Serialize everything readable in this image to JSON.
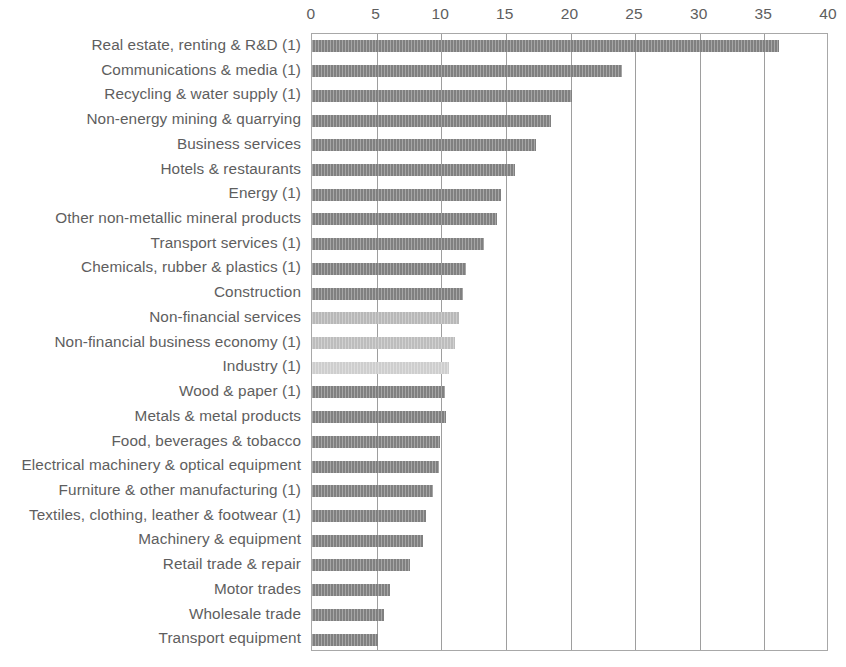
{
  "chart_data": {
    "type": "bar",
    "orientation": "horizontal",
    "title": "",
    "subtitle": "",
    "xlabel": "",
    "ylabel": "",
    "xlim": [
      0,
      40
    ],
    "xticks": [
      0,
      5,
      10,
      15,
      20,
      25,
      30,
      35,
      40
    ],
    "xtick_labels": [
      "0",
      "5",
      "10",
      "15",
      "20",
      "25",
      "30",
      "35",
      "40"
    ],
    "grid": true,
    "grid_axis": "x",
    "legend": null,
    "axis_position": "top",
    "categories": [
      "Real estate, renting & R&D (1)",
      "Communications & media (1)",
      "Recycling & water supply (1)",
      "Non-energy mining & quarrying",
      "Business services",
      "Hotels & restaurants",
      "Energy (1)",
      "Other non-metallic mineral products",
      "Transport services (1)",
      "Chemicals, rubber & plastics (1)",
      "Construction",
      "Non-financial services",
      "Non-financial business economy (1)",
      "Industry (1)",
      "Wood & paper (1)",
      "Metals & metal products",
      "Food, beverages & tobacco",
      "Electrical machinery & optical equipment",
      "Furniture & other manufacturing (1)",
      "Textiles, clothing, leather & footwear (1)",
      "Machinery & equipment",
      "Retail trade & repair",
      "Motor trades",
      "Wholesale trade",
      "Transport equipment"
    ],
    "values": [
      36.1,
      24.0,
      20.1,
      18.5,
      17.3,
      15.7,
      14.6,
      14.3,
      13.3,
      11.9,
      11.7,
      11.4,
      11.1,
      10.6,
      10.3,
      10.4,
      9.9,
      9.8,
      9.4,
      8.8,
      8.6,
      7.6,
      6.0,
      5.6,
      5.1
    ],
    "bar_colors": [
      "#808080",
      "#808080",
      "#808080",
      "#808080",
      "#808080",
      "#808080",
      "#808080",
      "#808080",
      "#808080",
      "#808080",
      "#808080",
      "#b8b8b8",
      "#bdbdbd",
      "#cecece",
      "#808080",
      "#808080",
      "#808080",
      "#808080",
      "#808080",
      "#808080",
      "#808080",
      "#808080",
      "#808080",
      "#808080",
      "#808080"
    ],
    "colors": {
      "bar_default": "#808080",
      "bar_highlight_light": "#b8b8b8",
      "bar_highlight_lighter": "#bdbdbd",
      "bar_highlight_lightest": "#cecece",
      "grid": "#9e9e9e",
      "frame": "#a8a8a8",
      "text": "#5e5e5e",
      "background": "#ffffff"
    }
  }
}
